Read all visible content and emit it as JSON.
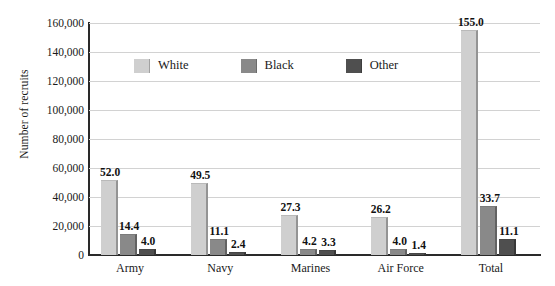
{
  "chart_data": {
    "type": "bar",
    "title": "",
    "subtitle": "",
    "xlabel": "",
    "ylabel": "Number of recruits",
    "ylim": [
      0,
      160000
    ],
    "ytick_values": [
      0,
      20000,
      40000,
      60000,
      80000,
      100000,
      120000,
      140000,
      160000
    ],
    "ytick_labels": [
      "0",
      "20,000",
      "40,000",
      "60,000",
      "80,000",
      "100,000",
      "120,000",
      "140,000",
      "160,000"
    ],
    "categories": [
      "Army",
      "Navy",
      "Marines",
      "Air Force",
      "Total"
    ],
    "grid": true,
    "legend_position": "upper-center",
    "value_label_units": "thousands",
    "series": [
      {
        "name": "White",
        "color": "#cfcfcf",
        "values": [
          52000,
          49500,
          27300,
          26200,
          155000
        ],
        "data_labels": [
          "52.0",
          "49.5",
          "27.3",
          "26.2",
          "155.0"
        ]
      },
      {
        "name": "Black",
        "color": "#898989",
        "values": [
          14400,
          11100,
          4200,
          4000,
          33700
        ],
        "data_labels": [
          "14.4",
          "11.1",
          "4.2",
          "4.0",
          "33.7"
        ]
      },
      {
        "name": "Other",
        "color": "#4f4f4f",
        "values": [
          4000,
          2400,
          3300,
          1400,
          11100
        ],
        "data_labels": [
          "4.0",
          "2.4",
          "3.3",
          "1.4",
          "11.1"
        ]
      }
    ]
  },
  "legend": {
    "items": [
      {
        "label": "White",
        "color": "#cfcfcf"
      },
      {
        "label": "Black",
        "color": "#898989"
      },
      {
        "label": "Other",
        "color": "#4f4f4f"
      }
    ]
  },
  "axes": {
    "y_title": "Number of recruits",
    "y_labels": [
      "160,000",
      "140,000",
      "120,000",
      "100,000",
      "80,000",
      "60,000",
      "40,000",
      "20,000",
      "0"
    ],
    "x_labels": [
      "Army",
      "Navy",
      "Marines",
      "Air Force",
      "Total"
    ]
  },
  "colors": {
    "white_series": "#cfcfcf",
    "black_series": "#898989",
    "other_series": "#4f4f4f",
    "gridline": "#d2d2d2",
    "axis": "#2a2a2a",
    "background": "#ffffff",
    "text": "#1a1a1a"
  }
}
